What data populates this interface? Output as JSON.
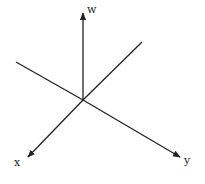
{
  "diagram": {
    "type": "coordinate-axes-3d",
    "stroke_color": "#222222",
    "background": "#ffffff",
    "origin": [
      83,
      100
    ],
    "axes": [
      {
        "name": "w",
        "label": "w",
        "from": [
          83,
          100
        ],
        "to": [
          83,
          13
        ],
        "arrow": true,
        "label_pos": [
          87,
          12
        ]
      },
      {
        "name": "x",
        "label": "x",
        "from": [
          83,
          100
        ],
        "to": [
          28,
          157
        ],
        "arrow": true,
        "label_pos": [
          17,
          161
        ]
      },
      {
        "name": "y",
        "label": "y",
        "from": [
          83,
          100
        ],
        "to": [
          180,
          157
        ],
        "arrow": true,
        "label_pos": [
          185,
          161
        ]
      },
      {
        "name": "x-negative",
        "label": "",
        "from": [
          83,
          100
        ],
        "to": [
          142,
          42
        ],
        "arrow": false
      },
      {
        "name": "y-negative",
        "label": "",
        "from": [
          83,
          100
        ],
        "to": [
          16,
          62
        ],
        "arrow": false
      }
    ]
  }
}
